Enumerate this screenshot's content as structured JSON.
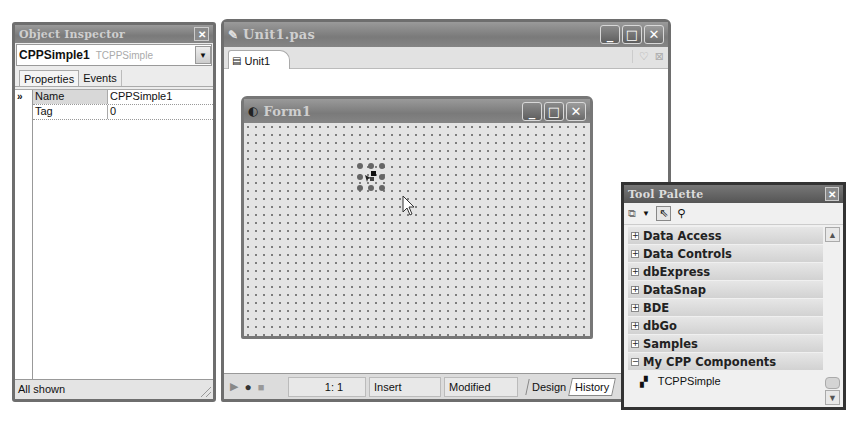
{
  "object_inspector": {
    "title": "Object Inspector",
    "selected_object": "CPPSimple1",
    "selected_type": "TCPPSimple",
    "tabs": [
      {
        "label": "Properties",
        "active": true
      },
      {
        "label": "Events",
        "active": false
      }
    ],
    "gutter_marker": "»",
    "properties": [
      {
        "name": "Name",
        "value": "CPPSimple1",
        "selected": true
      },
      {
        "name": "Tag",
        "value": "0",
        "selected": false
      }
    ],
    "status": "All shown"
  },
  "editor": {
    "title": "Unit1.pas",
    "tab_label": "Unit1",
    "status_bar": {
      "position": "1:  1",
      "mode": "Insert",
      "state": "Modified",
      "view_tabs": [
        {
          "label": "Design",
          "active": false
        },
        {
          "label": "History",
          "active": true
        }
      ]
    }
  },
  "form": {
    "title": "Form1"
  },
  "tool_palette": {
    "title": "Tool Palette",
    "categories": [
      {
        "label": "Data Access",
        "expanded": false,
        "symbol": "+"
      },
      {
        "label": "Data Controls",
        "expanded": false,
        "symbol": "+"
      },
      {
        "label": "dbExpress",
        "expanded": false,
        "symbol": "+"
      },
      {
        "label": "DataSnap",
        "expanded": false,
        "symbol": "+"
      },
      {
        "label": "BDE",
        "expanded": false,
        "symbol": "+"
      },
      {
        "label": "dbGo",
        "expanded": false,
        "symbol": "+"
      },
      {
        "label": "Samples",
        "expanded": false,
        "symbol": "+"
      },
      {
        "label": "My CPP Components",
        "expanded": true,
        "symbol": "−"
      }
    ],
    "components": [
      {
        "label": "TCPPSimple"
      }
    ]
  },
  "caption_buttons": {
    "minimize": "_",
    "maximize": "□",
    "close": "✕"
  }
}
